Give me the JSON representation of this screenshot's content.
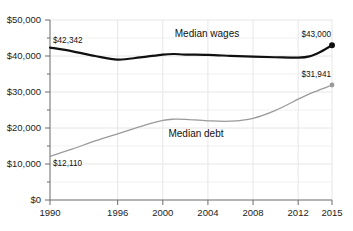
{
  "chart_data": {
    "type": "line",
    "title": "",
    "subtitle": "",
    "xlabel": "",
    "ylabel": "",
    "xlim": [
      1990,
      2015
    ],
    "ylim": [
      0,
      50000
    ],
    "grid": true,
    "legend_position": "inline-annotation",
    "y_ticks": [
      {
        "value": 0,
        "label": "$0"
      },
      {
        "value": 10000,
        "label": "$10,000"
      },
      {
        "value": 20000,
        "label": "$20,000"
      },
      {
        "value": 30000,
        "label": "$30,000"
      },
      {
        "value": 40000,
        "label": "$40,000"
      },
      {
        "value": 50000,
        "label": "$50,000"
      }
    ],
    "y_minor_ticks": [
      5000,
      15000,
      25000,
      35000,
      45000
    ],
    "x_ticks": [
      {
        "value": 1990,
        "label": "1990"
      },
      {
        "value": 1996,
        "label": "1996"
      },
      {
        "value": 2000,
        "label": "2000"
      },
      {
        "value": 2004,
        "label": "2004"
      },
      {
        "value": 2008,
        "label": "2008"
      },
      {
        "value": 2012,
        "label": "2012"
      },
      {
        "value": 2015,
        "label": "2015"
      }
    ],
    "x": [
      1990,
      1992,
      1994,
      1996,
      1998,
      2000,
      2001,
      2002,
      2004,
      2006,
      2008,
      2010,
      2012,
      2013,
      2014,
      2015
    ],
    "series": [
      {
        "name": "Median wages",
        "color": "#101010",
        "width": 2.2,
        "inline_label": "Median wages",
        "values": [
          42342,
          41300,
          40000,
          39000,
          39600,
          40400,
          40550,
          40400,
          40300,
          40050,
          39800,
          39650,
          39550,
          39900,
          41200,
          43000
        ],
        "start_label": "$42,342",
        "end_label": "$43,000",
        "start_value": 42342,
        "end_value": 43000,
        "end_marker": true
      },
      {
        "name": "Median debt",
        "color": "#9a9a9a",
        "width": 1.3,
        "inline_label": "Median debt",
        "values": [
          12110,
          14200,
          16400,
          18400,
          20400,
          22100,
          22450,
          22400,
          22000,
          21900,
          22700,
          24900,
          28000,
          29500,
          30700,
          31941
        ],
        "start_label": "$12,110",
        "end_label": "$31,941",
        "start_value": 12110,
        "end_value": 31941,
        "end_marker": true
      }
    ],
    "annotations": [
      {
        "name": "wages-start-value",
        "text": "$42,342"
      },
      {
        "name": "wages-end-value",
        "text": "$43,000"
      },
      {
        "name": "debt-start-value",
        "text": "$12,110"
      },
      {
        "name": "debt-end-value",
        "text": "$31,941"
      },
      {
        "name": "wages-series-label",
        "text": "Median wages"
      },
      {
        "name": "debt-series-label",
        "text": "Median debt"
      }
    ],
    "colors": {
      "wages_line": "#101010",
      "debt_line": "#9a9a9a",
      "axis": "#6b6b6b",
      "grid": "#e6e6e6",
      "background": "#ffffff",
      "text": "#1a1a1a"
    }
  }
}
